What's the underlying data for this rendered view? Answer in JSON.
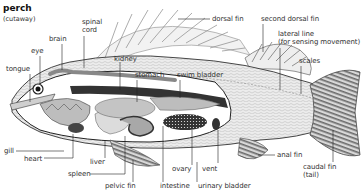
{
  "title": "perch",
  "subtitle": "(cutaway)",
  "colors": {
    "line": "#222222",
    "body_light": "#e6e6e6",
    "body_mid": "#bdbdbd",
    "organ_dark": "#555555",
    "fin_stripe": "#6a6a6a"
  },
  "labels": {
    "spinal_cord_1": "spinal",
    "spinal_cord_2": "cord",
    "brain": "brain",
    "eye": "eye",
    "tongue": "tongue",
    "kidney": "kidney",
    "stomach": "stomach",
    "swim_bladder": "swim bladder",
    "dorsal_fin": "dorsal fin",
    "second_dorsal_fin": "second dorsal fin",
    "lateral_line_1": "lateral line",
    "lateral_line_2": "(for sensing movement)",
    "scales": "scales",
    "gill": "gill",
    "heart": "heart",
    "liver": "liver",
    "spleen": "spleen",
    "pelvic_fin": "pelvic fin",
    "intestine": "intestine",
    "ovary": "ovary",
    "vent": "vent",
    "urinary_bladder": "urinary bladder",
    "anal_fin": "anal fin",
    "caudal_fin_1": "caudal fin",
    "caudal_fin_2": "(tail)"
  }
}
